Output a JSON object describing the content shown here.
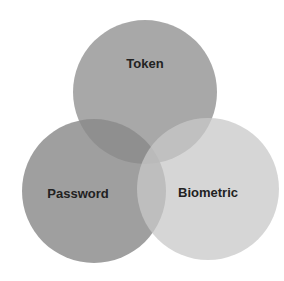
{
  "diagram": {
    "type": "venn",
    "circles": [
      {
        "id": "token",
        "label": "Token",
        "cx": 145,
        "cy": 92,
        "r": 72,
        "color": "#8f8f8f",
        "opacity": 0.78,
        "label_x": 145,
        "label_y": 68
      },
      {
        "id": "password",
        "label": "Password",
        "cx": 94,
        "cy": 191,
        "r": 72,
        "color": "#8a8a8a",
        "opacity": 0.82,
        "label_x": 78,
        "label_y": 198
      },
      {
        "id": "biometric",
        "label": "Biometric",
        "cx": 208,
        "cy": 189,
        "r": 71,
        "color": "#c8c8c8",
        "opacity": 0.75,
        "label_x": 208,
        "label_y": 197
      }
    ]
  }
}
